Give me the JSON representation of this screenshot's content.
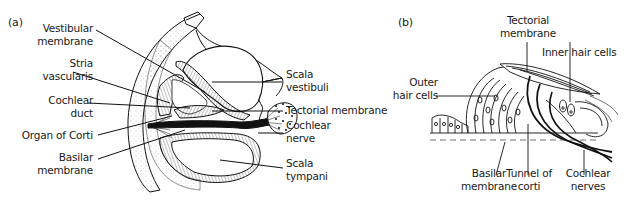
{
  "figure": {
    "panel_a": {
      "tag": "(a)",
      "labels": {
        "vestibular_membrane": [
          "Vestibular",
          "membrane"
        ],
        "stria_vascularis": [
          "Stria",
          "vascularis"
        ],
        "cochlear_duct": [
          "Cochlear",
          "duct"
        ],
        "organ_of_corti": "Organ of Corti",
        "basilar_membrane": [
          "Basilar",
          "membrane"
        ],
        "scala_vestibuli": [
          "Scala",
          "vestibuli"
        ],
        "tectorial_membrane": "Tectorial membrane",
        "cochlear_nerve": [
          "Cochlear",
          "nerve"
        ],
        "scala_tympani": [
          "Scala",
          "tympani"
        ]
      }
    },
    "panel_b": {
      "tag": "(b)",
      "labels": {
        "tectorial_membrane": [
          "Tectorial",
          "membrane"
        ],
        "inner_hair_cells": "Inner hair cells",
        "outer_hair_cells": [
          "Outer",
          "hair cells"
        ],
        "basilar_membrane": [
          "Basilar",
          "membrane"
        ],
        "tunnel_of_corti": [
          "Tunnel of",
          "corti"
        ],
        "cochlear_nerves": [
          "Cochlear",
          "nerves"
        ]
      }
    }
  }
}
